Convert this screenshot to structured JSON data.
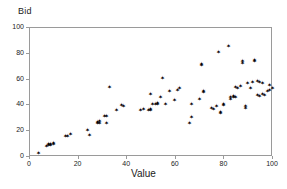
{
  "chart_data": {
    "type": "scatter",
    "title": "",
    "xlabel": "Value",
    "ylabel": "Bid",
    "xlim": [
      0,
      100
    ],
    "ylim": [
      0,
      100
    ],
    "xticks": [
      0,
      20,
      40,
      60,
      80,
      100
    ],
    "yticks": [
      0,
      20,
      40,
      60,
      80,
      100
    ],
    "grid": false,
    "legend": null,
    "marker": "star-asterisk",
    "marker_color": "#000000",
    "series": [
      {
        "name": "Bid vs Value",
        "points": [
          [
            4,
            2
          ],
          [
            7,
            7
          ],
          [
            8,
            8
          ],
          [
            8,
            9
          ],
          [
            9,
            8
          ],
          [
            9,
            9
          ],
          [
            10,
            9
          ],
          [
            10,
            10
          ],
          [
            15,
            15
          ],
          [
            16,
            15
          ],
          [
            17,
            17
          ],
          [
            24,
            20
          ],
          [
            25,
            16
          ],
          [
            28,
            26
          ],
          [
            28,
            25
          ],
          [
            29,
            27
          ],
          [
            29,
            25
          ],
          [
            31,
            31
          ],
          [
            32,
            25
          ],
          [
            32,
            31
          ],
          [
            33,
            53
          ],
          [
            36,
            35
          ],
          [
            38,
            39
          ],
          [
            39,
            38
          ],
          [
            46,
            35
          ],
          [
            47,
            36
          ],
          [
            49,
            35
          ],
          [
            50,
            48
          ],
          [
            50,
            35
          ],
          [
            50,
            36
          ],
          [
            51,
            40
          ],
          [
            52,
            40
          ],
          [
            53,
            41
          ],
          [
            53,
            40
          ],
          [
            54,
            45
          ],
          [
            55,
            60
          ],
          [
            56,
            40
          ],
          [
            58,
            50
          ],
          [
            60,
            43
          ],
          [
            61,
            51
          ],
          [
            62,
            52
          ],
          [
            66,
            25
          ],
          [
            67,
            30
          ],
          [
            67,
            40
          ],
          [
            70,
            44
          ],
          [
            71,
            71
          ],
          [
            71,
            70
          ],
          [
            72,
            50
          ],
          [
            72,
            49
          ],
          [
            75,
            37
          ],
          [
            76,
            36
          ],
          [
            77,
            38
          ],
          [
            78,
            80
          ],
          [
            79,
            33
          ],
          [
            79,
            34
          ],
          [
            80,
            40
          ],
          [
            80,
            39
          ],
          [
            82,
            85
          ],
          [
            83,
            45
          ],
          [
            83,
            44
          ],
          [
            84,
            45
          ],
          [
            84,
            46
          ],
          [
            85,
            45
          ],
          [
            85,
            53
          ],
          [
            86,
            52
          ],
          [
            87,
            54
          ],
          [
            88,
            72
          ],
          [
            88,
            73
          ],
          [
            89,
            37
          ],
          [
            89,
            38
          ],
          [
            90,
            56
          ],
          [
            91,
            52
          ],
          [
            92,
            57
          ],
          [
            93,
            74
          ],
          [
            93,
            73
          ],
          [
            94,
            47
          ],
          [
            94,
            58
          ],
          [
            95,
            46
          ],
          [
            95,
            57
          ],
          [
            96,
            48
          ],
          [
            96,
            56
          ],
          [
            97,
            47
          ],
          [
            98,
            50
          ],
          [
            99,
            55
          ],
          [
            99,
            51
          ],
          [
            100,
            52
          ]
        ]
      }
    ]
  },
  "axes": {
    "y_title": "Bid",
    "x_title": "Value",
    "y_tick_labels": [
      "100",
      "80",
      "60",
      "40",
      "20",
      "0"
    ],
    "x_tick_labels": [
      "0",
      "20",
      "40",
      "60",
      "80",
      "100"
    ]
  },
  "colors": {
    "axis": "#9a9a9a",
    "text": "#1a1a1a",
    "marker": "#000000",
    "background": "#ffffff"
  }
}
